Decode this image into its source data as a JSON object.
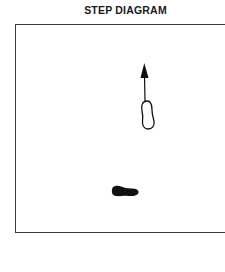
{
  "title": "STEP DIAGRAM",
  "diagram": {
    "elements": [
      {
        "type": "arrow",
        "direction": "up",
        "description": "direction of step"
      },
      {
        "type": "footprint",
        "style": "outline",
        "description": "stepping foot (new position)"
      },
      {
        "type": "footprint",
        "style": "filled",
        "description": "supporting foot"
      }
    ],
    "colors": {
      "ink": "#111111",
      "frame": "#3a3a3a",
      "background": "#ffffff"
    }
  }
}
